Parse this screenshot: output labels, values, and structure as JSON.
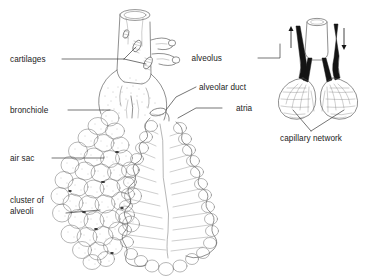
{
  "figure": {
    "background_color": "#ffffff",
    "ink_color": "#4a4a4a",
    "text_color": "#1b1b1b",
    "vessel_color": "#141414",
    "width": 368,
    "height": 277
  },
  "labels": {
    "cartilages": "cartilages",
    "bronchiole": "bronchiole",
    "air_sac": "air sac",
    "cluster_of_alveoli_line1": "cluster of",
    "cluster_of_alveoli_line2": "alveoli",
    "alveolar_duct": "alveolar duct",
    "atria": "atria",
    "alveolus": "alveolus",
    "capillary_network": "capillary network"
  },
  "structures": {
    "main_bronchiole": "branching bronchiole with cartilage plates",
    "left_branch": "stippled cluster of alveolar sacs (exterior view)",
    "right_branch": "alveolar duct with scalloped atria (cutaway view)",
    "inset": "detail of two alveoli wrapped in capillary network with blood flow arrows"
  },
  "inset": {
    "flow_in_arrow": "down",
    "flow_out_arrow": "up"
  }
}
